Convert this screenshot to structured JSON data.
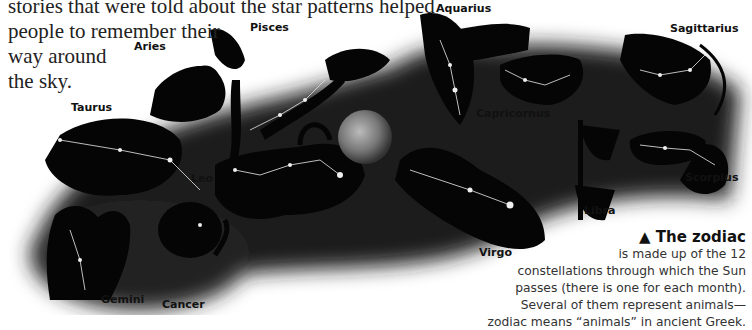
{
  "intro_text": {
    "lines": [
      "stories that were told about the star patterns helped",
      "people to remember their",
      "way around",
      "the sky."
    ]
  },
  "illustration": {
    "subject": "zodiac constellations figures with star patterns around Earth",
    "earth_icon": "earth-globe",
    "labels": {
      "aries": "Aries",
      "pisces": "Pisces",
      "aquarius": "Aquarius",
      "sagittarius": "Sagittarius",
      "taurus": "Taurus",
      "capricornus": "Capricornus",
      "leo": "Leo",
      "libra": "Libra",
      "scorpius": "Scorpius",
      "virgo": "Virgo",
      "gemini": "Gemini",
      "cancer": "Cancer"
    }
  },
  "caption": {
    "marker": "▲",
    "title": "The zodiac",
    "lines": [
      "is made up of the 12",
      "constellations through which the Sun",
      "passes (there is one for each month).",
      "Several of them represent animals—",
      "zodiac means “animals” in ancient Greek."
    ]
  }
}
